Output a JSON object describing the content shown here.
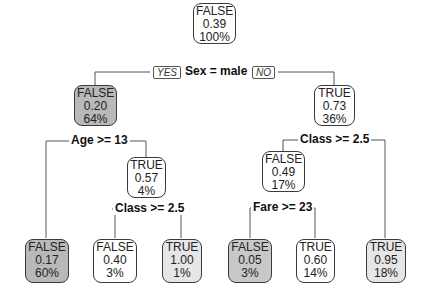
{
  "tree": {
    "nodes": [
      {
        "id": "root",
        "label": "FALSE",
        "prob": "0.39",
        "pct": "100%"
      },
      {
        "id": "n2",
        "label": "FALSE",
        "prob": "0.20",
        "pct": "64%"
      },
      {
        "id": "n3",
        "label": "TRUE",
        "prob": "0.73",
        "pct": "36%"
      },
      {
        "id": "n5",
        "label": "TRUE",
        "prob": "0.57",
        "pct": "4%"
      },
      {
        "id": "n6",
        "label": "FALSE",
        "prob": "0.49",
        "pct": "17%"
      },
      {
        "id": "leaf4",
        "label": "FALSE",
        "prob": "0.17",
        "pct": "60%"
      },
      {
        "id": "leaf10",
        "label": "FALSE",
        "prob": "0.40",
        "pct": "3%"
      },
      {
        "id": "leaf11",
        "label": "TRUE",
        "prob": "1.00",
        "pct": "1%"
      },
      {
        "id": "leaf12",
        "label": "FALSE",
        "prob": "0.05",
        "pct": "3%"
      },
      {
        "id": "leaf13",
        "label": "TRUE",
        "prob": "0.60",
        "pct": "14%"
      },
      {
        "id": "leaf7",
        "label": "TRUE",
        "prob": "0.95",
        "pct": "18%"
      }
    ],
    "splits": {
      "sex": "Sex = male",
      "age": "Age >= 13",
      "class_left": "Class >= 2.5",
      "class_right": "Class >= 2.5",
      "fare": "Fare >= 23"
    },
    "yes_label": "YES",
    "no_label": "NO"
  }
}
